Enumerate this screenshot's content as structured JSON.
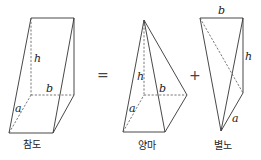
{
  "figure": {
    "solids": [
      {
        "id": "chamdo",
        "caption": "참도",
        "labels": {
          "h": "h",
          "a": "a",
          "b": "b"
        }
      },
      {
        "id": "yangma",
        "caption": "양마",
        "labels": {
          "h": "h",
          "a": "a",
          "b": "b"
        }
      },
      {
        "id": "byeolno",
        "caption": "별노",
        "labels": {
          "h": "h",
          "a": "a",
          "b": "b"
        }
      }
    ],
    "operators": {
      "equals": "=",
      "plus": "+"
    }
  }
}
